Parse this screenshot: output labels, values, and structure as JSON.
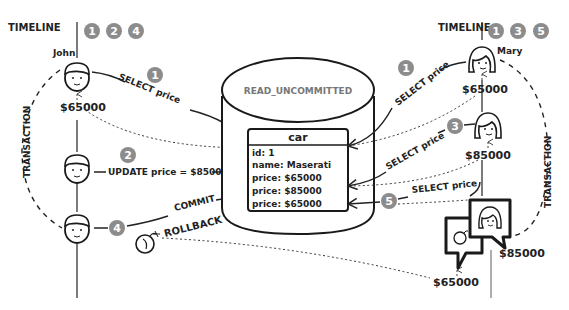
{
  "database": {
    "label": "READ_UNCOMMITTED",
    "table": {
      "name": "car",
      "rows": [
        "id: 1",
        "name: Maserati",
        "price: $65000",
        "price: $85000",
        "price: $65000"
      ]
    }
  },
  "left": {
    "timeline_label": "TIMELINE",
    "timeline_steps": [
      "1",
      "2",
      "4"
    ],
    "user_name": "John",
    "transaction_label": "TRANSACTION",
    "value_read": "$65000",
    "steps": [
      {
        "badge": "1",
        "label": "SELECT price"
      },
      {
        "badge": "2",
        "label": "UPDATE price = $85000"
      },
      {
        "badge": "4",
        "label": "COMMIT",
        "alt_label": "ROLLBACK"
      }
    ]
  },
  "right": {
    "timeline_label": "TIMELINE",
    "timeline_steps": [
      "1",
      "3",
      "5"
    ],
    "user_name": "Mary",
    "transaction_label": "TRANSACTION",
    "steps": [
      {
        "badge": "1",
        "label": "SELECT price",
        "value": "$65000"
      },
      {
        "badge": "3",
        "label": "SELECT price",
        "value": "$85000"
      },
      {
        "badge": "5",
        "label": "SELECT price",
        "value": "$85000",
        "actual_value": "$65000"
      }
    ]
  },
  "icons": [
    "user-face-icon",
    "bomb-icon",
    "speech-bubble-icon"
  ]
}
